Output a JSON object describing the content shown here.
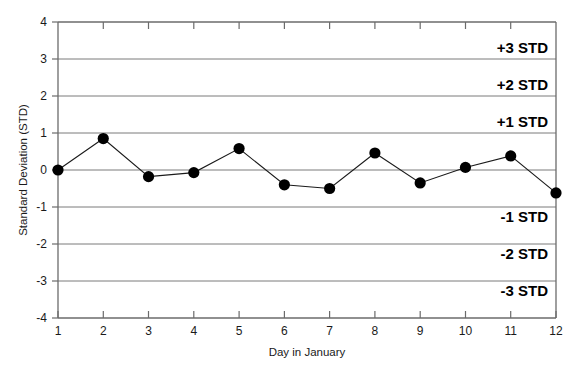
{
  "chart_data": {
    "type": "line",
    "title": "",
    "subtitle": "",
    "xlabel": "Day in January",
    "ylabel": "Standard Deviation (STD)",
    "x": [
      1,
      2,
      3,
      4,
      5,
      6,
      7,
      8,
      9,
      10,
      11,
      12
    ],
    "values": [
      0.0,
      0.85,
      -0.18,
      -0.07,
      0.58,
      -0.4,
      -0.5,
      0.46,
      -0.35,
      0.07,
      0.38,
      -0.62
    ],
    "series": [
      {
        "name": "Standard Deviation",
        "values": [
          0.0,
          0.85,
          -0.18,
          -0.07,
          0.58,
          -0.4,
          -0.5,
          0.46,
          -0.35,
          0.07,
          0.38,
          -0.62
        ]
      }
    ],
    "xlim": [
      1,
      12
    ],
    "ylim": [
      -4,
      4
    ],
    "xticks": [
      1,
      2,
      3,
      4,
      5,
      6,
      7,
      8,
      9,
      10,
      11,
      12
    ],
    "xticklabels": [
      "1",
      "2",
      "3",
      "4",
      "5",
      "6",
      "7",
      "8",
      "9",
      "10",
      "11",
      "12"
    ],
    "yticks": [
      4,
      3,
      2,
      1,
      0,
      -1,
      -2,
      -3,
      -4
    ],
    "yticklabels": [
      "4",
      "3",
      "2",
      "1",
      "0",
      "-1",
      "-2",
      "-3",
      "-4"
    ],
    "gridlines_y": [
      3,
      2,
      1,
      0,
      -1,
      -2,
      -3
    ],
    "grid": true,
    "legend": false,
    "legend_position": "none",
    "marker": "filled-circle",
    "marker_color": "#000000",
    "line_color": "#1a1a1a",
    "grid_color": "#808080",
    "axis_color": "#595959",
    "background": "#ffffff",
    "annotations": [
      {
        "text": "+3 STD",
        "y": 3,
        "align": "right",
        "placement": "above-line"
      },
      {
        "text": "+2 STD",
        "y": 2,
        "align": "right",
        "placement": "above-line"
      },
      {
        "text": "+1 STD",
        "y": 1,
        "align": "right",
        "placement": "above-line"
      },
      {
        "text": "-1 STD",
        "y": -1,
        "align": "right",
        "placement": "below-line"
      },
      {
        "text": "-2 STD",
        "y": -2,
        "align": "right",
        "placement": "below-line"
      },
      {
        "text": "-3 STD",
        "y": -3,
        "align": "right",
        "placement": "below-line"
      }
    ]
  },
  "axes": {
    "y_title": "Standard Deviation (STD)",
    "x_title": "Day in January",
    "y_tick_4": "4",
    "y_tick_3": "3",
    "y_tick_2": "2",
    "y_tick_1": "1",
    "y_tick_0": "0",
    "y_tick_m1": "-1",
    "y_tick_m2": "-2",
    "y_tick_m3": "-3",
    "y_tick_m4": "-4",
    "x_tick_1": "1",
    "x_tick_2": "2",
    "x_tick_3": "3",
    "x_tick_4": "4",
    "x_tick_5": "5",
    "x_tick_6": "6",
    "x_tick_7": "7",
    "x_tick_8": "8",
    "x_tick_9": "9",
    "x_tick_10": "10",
    "x_tick_11": "11",
    "x_tick_12": "12"
  },
  "band_labels": {
    "plus3": "+3 STD",
    "plus2": "+2 STD",
    "plus1": "+1 STD",
    "minus1": "-1 STD",
    "minus2": "-2 STD",
    "minus3": "-3 STD"
  }
}
